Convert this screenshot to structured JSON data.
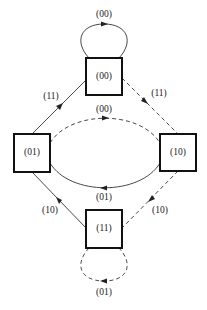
{
  "diagram": {
    "type": "state-transition",
    "nodes": [
      {
        "id": "s00",
        "label": "(00)",
        "position": "top"
      },
      {
        "id": "s01",
        "label": "(01)",
        "position": "left"
      },
      {
        "id": "s10",
        "label": "(10)",
        "position": "right"
      },
      {
        "id": "s11",
        "label": "(11)",
        "position": "bottom"
      }
    ],
    "edges": [
      {
        "from": "s00",
        "to": "s00",
        "label": "(00)",
        "style": "solid"
      },
      {
        "from": "s01",
        "to": "s00",
        "label": "(11)",
        "style": "solid"
      },
      {
        "from": "s00",
        "to": "s10",
        "label": "(11)",
        "style": "dashed"
      },
      {
        "from": "s01",
        "to": "s10",
        "label": "(00)",
        "style": "dashed"
      },
      {
        "from": "s10",
        "to": "s01",
        "label": "(01)",
        "style": "solid"
      },
      {
        "from": "s11",
        "to": "s01",
        "label": "(10)",
        "style": "solid"
      },
      {
        "from": "s10",
        "to": "s11",
        "label": "(10)",
        "style": "dashed"
      },
      {
        "from": "s11",
        "to": "s11",
        "label": "(01)",
        "style": "dashed"
      }
    ]
  }
}
